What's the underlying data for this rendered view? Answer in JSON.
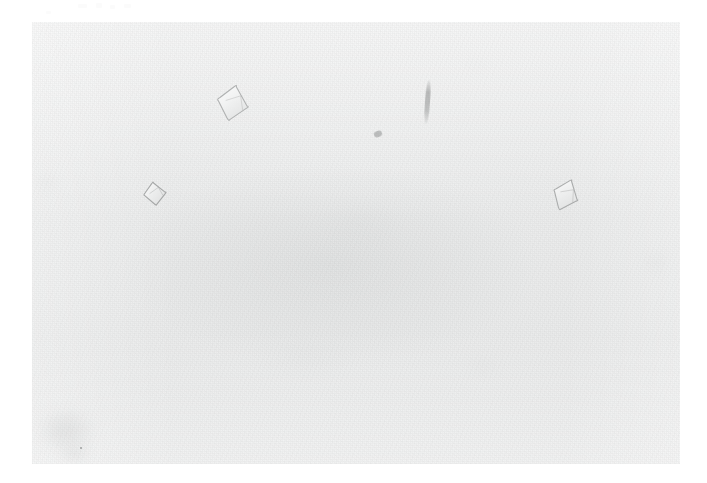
{
  "image": {
    "kind": "photomicrograph",
    "subject": "protein crystals in drop",
    "background_color": "#e9eaea",
    "page_color": "#ffffff",
    "plate": {
      "x": 32,
      "y": 22,
      "width": 648,
      "height": 442
    }
  },
  "scan_artifacts": [
    {
      "name": "artifact-1",
      "x": 78,
      "y": 4,
      "width": 9,
      "height": 4
    },
    {
      "name": "artifact-2",
      "x": 96,
      "y": 3,
      "width": 6,
      "height": 5
    },
    {
      "name": "artifact-3",
      "x": 110,
      "y": 5,
      "width": 5,
      "height": 4
    },
    {
      "name": "artifact-4",
      "x": 124,
      "y": 4,
      "width": 7,
      "height": 4
    },
    {
      "name": "artifact-5",
      "x": 46,
      "y": 11,
      "width": 5,
      "height": 3
    }
  ],
  "specimens": [
    {
      "id": "crystal-1",
      "label": "large rhombic crystal",
      "shape": "rhombus",
      "x": 216,
      "y": 84,
      "width": 34,
      "height": 38,
      "rotation_deg": 12,
      "edge_color": "#a9abab",
      "fill_color": "#f2f3f3"
    },
    {
      "id": "crystal-2",
      "label": "small rhombic crystal",
      "shape": "rhombus",
      "x": 143,
      "y": 181,
      "width": 24,
      "height": 25,
      "rotation_deg": -8,
      "edge_color": "#9fa1a1",
      "fill_color": "#eeefef"
    },
    {
      "id": "crystal-3",
      "label": "right rhombic crystal",
      "shape": "rhombus",
      "x": 552,
      "y": 178,
      "width": 28,
      "height": 34,
      "rotation_deg": 22,
      "edge_color": "#a4a6a6",
      "fill_color": "#eff0f0"
    },
    {
      "id": "needle-1",
      "label": "needle-like inclusion",
      "shape": "needle",
      "x": 425,
      "y": 80,
      "width": 5,
      "height": 44,
      "rotation_deg": 4,
      "edge_color": "#848686",
      "fill_color": "#9a9c9c"
    },
    {
      "id": "speck-1",
      "label": "small debris speck",
      "shape": "speck",
      "x": 374,
      "y": 131,
      "width": 8,
      "height": 6,
      "rotation_deg": -20,
      "edge_color": "#8f9191",
      "fill_color": "#a8aaaa"
    },
    {
      "id": "dot-1",
      "label": "dark pinpoint",
      "shape": "dot",
      "x": 80,
      "y": 447,
      "width": 2,
      "height": 2,
      "rotation_deg": 0,
      "edge_color": "#6a6c6c",
      "fill_color": "#6a6c6c"
    }
  ],
  "blotches": [
    {
      "name": "blotch-bottom-left",
      "x": 22,
      "y": 398,
      "width": 88,
      "height": 66,
      "opacity": 0.3,
      "color": "#bfc1c1"
    },
    {
      "name": "blotch-bottom-left-2",
      "x": 52,
      "y": 442,
      "width": 46,
      "height": 24,
      "opacity": 0.26,
      "color": "#b5b7b7"
    },
    {
      "name": "blotch-left-edge",
      "x": 34,
      "y": 168,
      "width": 26,
      "height": 30,
      "opacity": 0.16,
      "color": "#c6c8c8"
    },
    {
      "name": "blotch-top-right",
      "x": 460,
      "y": 56,
      "width": 34,
      "height": 18,
      "opacity": 0.1,
      "color": "#c8caca"
    },
    {
      "name": "blotch-right-mid",
      "x": 636,
      "y": 246,
      "width": 40,
      "height": 34,
      "opacity": 0.12,
      "color": "#c8caca"
    },
    {
      "name": "blotch-bottom-right",
      "x": 456,
      "y": 352,
      "width": 54,
      "height": 28,
      "opacity": 0.11,
      "color": "#c9cbcb"
    },
    {
      "name": "blotch-center",
      "x": 300,
      "y": 190,
      "width": 120,
      "height": 70,
      "opacity": 0.09,
      "color": "#cccece"
    },
    {
      "name": "blotch-lower-center",
      "x": 230,
      "y": 330,
      "width": 150,
      "height": 60,
      "opacity": 0.08,
      "color": "#cbcdcd"
    }
  ]
}
